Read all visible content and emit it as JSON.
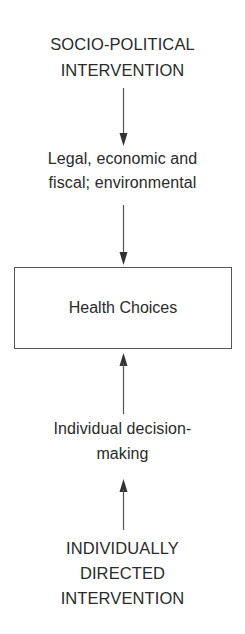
{
  "diagram": {
    "top_node": {
      "line1": "SOCIO-POLITICAL",
      "line2": "INTERVENTION"
    },
    "upper_mechanism": {
      "line1": "Legal, economic and",
      "line2": "fiscal; environmental"
    },
    "center_box": {
      "label": "Health Choices"
    },
    "lower_mechanism": {
      "line1": "Individual decision-",
      "line2": "making"
    },
    "bottom_node": {
      "line1": "INDIVIDUALLY",
      "line2": "DIRECTED",
      "line3": "INTERVENTION"
    },
    "arrows": [
      {
        "from": "top_node",
        "to": "upper_mechanism",
        "direction": "down"
      },
      {
        "from": "upper_mechanism",
        "to": "center_box",
        "direction": "down"
      },
      {
        "from": "lower_mechanism",
        "to": "center_box",
        "direction": "up"
      },
      {
        "from": "bottom_node",
        "to": "lower_mechanism",
        "direction": "up"
      }
    ],
    "colors": {
      "stroke": "#555555",
      "text": "#2a2a2a",
      "background": "#ffffff"
    }
  }
}
